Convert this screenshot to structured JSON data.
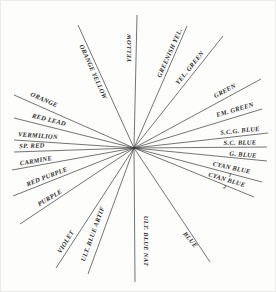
{
  "diagram": {
    "background": "#fdfdfc",
    "line_color": "#3a3a3a",
    "line_width": 0.7,
    "label_color": "#2b2b2b",
    "center": {
      "x": 134,
      "y": 148
    },
    "rays": [
      {
        "id": "orange-yellow",
        "label": "ORANGE YELLOW",
        "end": {
          "x": 78,
          "y": 25
        },
        "t": 0.63,
        "ox": -6,
        "oy": 1,
        "rot": 66
      },
      {
        "id": "yellow",
        "label": "YELLOW",
        "end": {
          "x": 137,
          "y": 15
        },
        "t": 0.75,
        "ox": -7,
        "oy": 0,
        "rot": -90
      },
      {
        "id": "greenish-yellow",
        "label": "GREENISH YEL.",
        "end": {
          "x": 187,
          "y": 26
        },
        "t": 0.76,
        "ox": -4,
        "oy": -2,
        "rot": -66
      },
      {
        "id": "yellow-green",
        "label": "YEL. GREEN",
        "end": {
          "x": 223,
          "y": 36
        },
        "t": 0.66,
        "ox": -3,
        "oy": -6,
        "rot": -51
      },
      {
        "id": "green",
        "label": "GREEN",
        "end": {
          "x": 261,
          "y": 79
        },
        "t": 0.72,
        "ox": 0,
        "oy": -7,
        "rot": -28
      },
      {
        "id": "emerald-green",
        "label": "EM. GREEN",
        "end": {
          "x": 262,
          "y": 109
        },
        "t": 0.79,
        "ox": 0,
        "oy": -7,
        "rot": -16
      },
      {
        "id": "scg-blue",
        "label": "S.C.G. BLUE",
        "end": {
          "x": 268,
          "y": 133
        },
        "t": 0.79,
        "ox": 0,
        "oy": -5,
        "rot": -6
      },
      {
        "id": "sc-blue",
        "label": "S.C. BLUE",
        "end": {
          "x": 267,
          "y": 147
        },
        "t": 0.8,
        "ox": 0,
        "oy": -4,
        "rot": -1
      },
      {
        "id": "g-blue",
        "label": "G. BLUE",
        "end": {
          "x": 267,
          "y": 161
        },
        "t": 0.82,
        "ox": 0,
        "oy": -4,
        "rot": 5
      },
      {
        "id": "cyan-blue-1",
        "label": "CYAN BLUE",
        "sub": "1",
        "end": {
          "x": 262,
          "y": 182
        },
        "t": 0.76,
        "ox": 0,
        "oy": -3,
        "rot": 12
      },
      {
        "id": "cyan-blue-2",
        "label": "CYAN BLUE",
        "sub": "2",
        "end": {
          "x": 254,
          "y": 197
        },
        "t": 0.77,
        "ox": 0,
        "oy": -3,
        "rot": 17
      },
      {
        "id": "blue",
        "label": "BLUE",
        "end": {
          "x": 210,
          "y": 262
        },
        "t": 0.78,
        "ox": -3,
        "oy": 3,
        "rot": 50
      },
      {
        "id": "ult-blue-nat",
        "label": "ULT. BLUE NAT",
        "end": {
          "x": 135,
          "y": 282
        },
        "t": 0.69,
        "ox": 11,
        "oy": 1,
        "rot": 90
      },
      {
        "id": "ult-blue-artif",
        "label": "ULT. BLUE ARTIF",
        "end": {
          "x": 88,
          "y": 274
        },
        "t": 0.7,
        "ox": -9,
        "oy": -2,
        "rot": -70
      },
      {
        "id": "violet",
        "label": "VIOLET",
        "end": {
          "x": 56,
          "y": 268
        },
        "t": 0.8,
        "ox": -6,
        "oy": -2,
        "rot": -58
      },
      {
        "id": "purple",
        "label": "PURPLE",
        "end": {
          "x": 20,
          "y": 224
        },
        "t": 0.74,
        "ox": 0,
        "oy": -6,
        "rot": -30
      },
      {
        "id": "red-purple",
        "label": "RED PURPLE",
        "end": {
          "x": 13,
          "y": 196
        },
        "t": 0.73,
        "ox": 1,
        "oy": -6,
        "rot": -21
      },
      {
        "id": "carmine",
        "label": "CARMINE",
        "end": {
          "x": 12,
          "y": 170
        },
        "t": 0.8,
        "ox": 0,
        "oy": -5,
        "rot": -10
      },
      {
        "id": "sp-red",
        "label": "SP. RED",
        "end": {
          "x": 14,
          "y": 152
        },
        "t": 0.85,
        "ox": 0,
        "oy": -5,
        "rot": -2
      },
      {
        "id": "vermilion",
        "label": "VERMILION",
        "end": {
          "x": 14,
          "y": 140
        },
        "t": 0.8,
        "ox": 0,
        "oy": -6,
        "rot": 4
      },
      {
        "id": "red-lead",
        "label": "RED LEAD",
        "end": {
          "x": 14,
          "y": 118
        },
        "t": 0.71,
        "ox": 0,
        "oy": -7,
        "rot": 14
      },
      {
        "id": "orange",
        "label": "ORANGE",
        "end": {
          "x": 14,
          "y": 95
        },
        "t": 0.75,
        "ox": 0,
        "oy": -8,
        "rot": 24
      }
    ]
  }
}
